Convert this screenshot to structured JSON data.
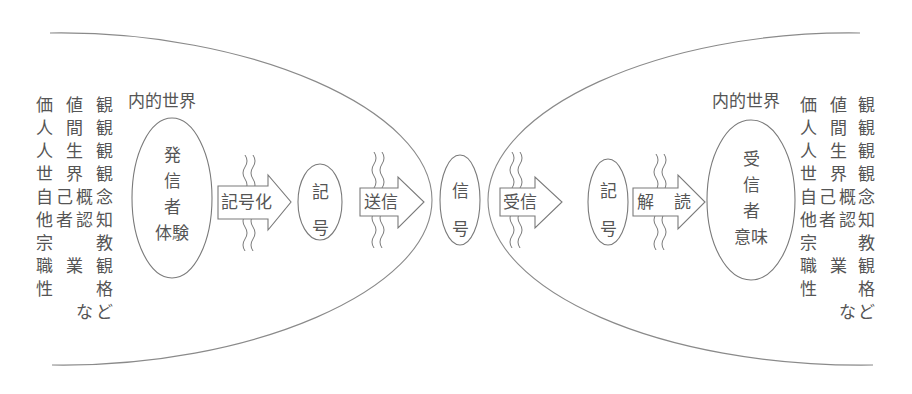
{
  "diagram": {
    "type": "communication-model",
    "stroke_color": "#7a7a7a",
    "text_color": "#555555",
    "sender": {
      "inner_world_label": "内的世界",
      "ellipse_lines": [
        "発",
        "信",
        "者",
        "体験"
      ],
      "values_rows": [
        [
          "価",
          "値",
          "観"
        ],
        [
          "人",
          "間",
          "観"
        ],
        [
          "人",
          "生",
          "観"
        ],
        [
          "世",
          "界",
          "観"
        ],
        [
          "自",
          "己",
          "概",
          "念"
        ],
        [
          "他",
          "者",
          "認",
          "知"
        ],
        [
          "宗",
          "",
          "教",
          "観"
        ],
        [
          "職",
          "",
          "業",
          "観"
        ],
        [
          "性",
          "",
          "",
          "格"
        ],
        [
          "",
          "",
          "な",
          "ど"
        ]
      ],
      "values_list": [
        "価値観",
        "人間観",
        "人生観",
        "世界観",
        "自己概念",
        "他者認知",
        "宗教観",
        "職業観",
        "性格",
        "など"
      ]
    },
    "receiver": {
      "inner_world_label": "内的世界",
      "ellipse_lines": [
        "受",
        "信",
        "者",
        "意味"
      ],
      "values_list": [
        "価値観",
        "人間観",
        "人生観",
        "世界観",
        "自己概念",
        "他者認知",
        "宗教観",
        "職業観",
        "性格",
        "など"
      ]
    },
    "flow": [
      {
        "kind": "arrow",
        "label": "記号化"
      },
      {
        "kind": "node",
        "lines": [
          "記",
          "号"
        ]
      },
      {
        "kind": "arrow",
        "label": "送信"
      },
      {
        "kind": "node",
        "lines": [
          "信",
          "号"
        ]
      },
      {
        "kind": "arrow",
        "label": "受信"
      },
      {
        "kind": "node",
        "lines": [
          "記",
          "号"
        ]
      },
      {
        "kind": "arrow",
        "label_left": "解",
        "label_right": "読"
      }
    ],
    "noise_marks": "wavy-lines"
  }
}
